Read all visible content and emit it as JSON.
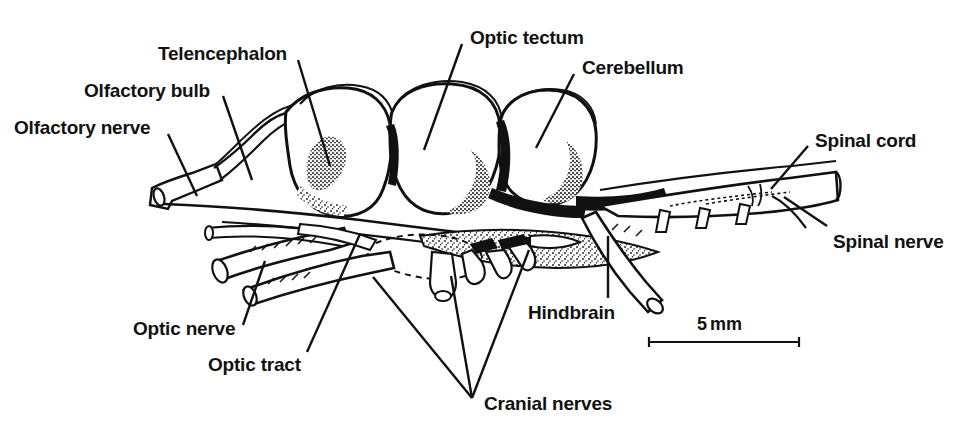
{
  "figure": {
    "kind": "anatomical-line-drawing",
    "background_color": "#ffffff",
    "ink_color": "#111111",
    "width": 966,
    "height": 427
  },
  "labels": [
    {
      "id": "olfactory-nerve",
      "text": "Olfactory nerve",
      "x": 14,
      "y": 118,
      "leader": {
        "x1": 168,
        "y1": 134,
        "x2": 197,
        "y2": 196
      }
    },
    {
      "id": "olfactory-bulb",
      "text": "Olfactory bulb",
      "x": 84,
      "y": 81,
      "leader": {
        "x1": 223,
        "y1": 96,
        "x2": 252,
        "y2": 180
      }
    },
    {
      "id": "telencephalon",
      "text": "Telencephalon",
      "x": 158,
      "y": 44,
      "leader": {
        "x1": 298,
        "y1": 60,
        "x2": 330,
        "y2": 166
      }
    },
    {
      "id": "optic-tectum",
      "text": "Optic tectum",
      "x": 470,
      "y": 28,
      "leader": {
        "x1": 462,
        "y1": 44,
        "x2": 424,
        "y2": 150
      }
    },
    {
      "id": "cerebellum",
      "text": "Cerebellum",
      "x": 582,
      "y": 58,
      "leader": {
        "x1": 574,
        "y1": 74,
        "x2": 536,
        "y2": 148
      }
    },
    {
      "id": "spinal-cord",
      "text": "Spinal cord",
      "x": 815,
      "y": 131,
      "leader": {
        "x1": 808,
        "y1": 146,
        "x2": 771,
        "y2": 189
      }
    },
    {
      "id": "spinal-nerve",
      "text": "Spinal nerve",
      "x": 833,
      "y": 232,
      "leader": {
        "x1": 827,
        "y1": 226,
        "x2": 784,
        "y2": 197
      }
    },
    {
      "id": "hindbrain",
      "text": "Hindbrain",
      "x": 528,
      "y": 303,
      "leader": {
        "x1": 608,
        "y1": 298,
        "x2": 608,
        "y2": 236
      }
    },
    {
      "id": "optic-nerve",
      "text": "Optic nerve",
      "x": 133,
      "y": 319,
      "leader": {
        "x1": 243,
        "y1": 325,
        "x2": 265,
        "y2": 261
      }
    },
    {
      "id": "optic-tract",
      "text": "Optic tract",
      "x": 208,
      "y": 355,
      "leader": {
        "x1": 307,
        "y1": 352,
        "x2": 360,
        "y2": 234
      }
    },
    {
      "id": "cranial-nerves",
      "text": "Cranial nerves",
      "x": 484,
      "y": 394
    }
  ],
  "cranial_nerves_leaders": {
    "converge": {
      "x": 472,
      "y": 398
    },
    "targets": [
      {
        "x": 373,
        "y": 277
      },
      {
        "x": 451,
        "y": 276
      },
      {
        "x": 529,
        "y": 250
      }
    ]
  },
  "scale_bar": {
    "value": "5",
    "unit": "mm",
    "label_x": 697,
    "label_y": 315,
    "line": {
      "x1": 649,
      "y1": 342,
      "x2": 799,
      "y2": 342
    },
    "tick_height": 9
  }
}
